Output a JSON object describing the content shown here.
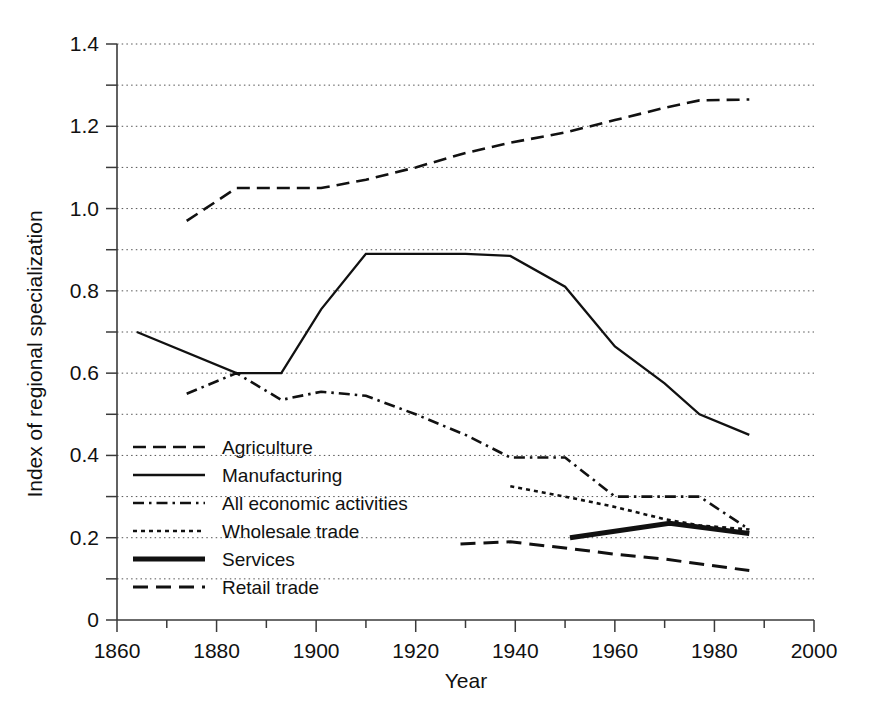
{
  "chart_data": {
    "type": "line",
    "title": "",
    "xlabel": "Year",
    "ylabel": "Index of regional specialization",
    "xlim": [
      1860,
      2000
    ],
    "ylim": [
      0,
      1.4
    ],
    "xticks": [
      1860,
      1880,
      1900,
      1920,
      1940,
      1960,
      1980,
      2000
    ],
    "xtick_labels": [
      "1860",
      "1880",
      "1900",
      "1920",
      "1940",
      "1960",
      "1980",
      "2000"
    ],
    "xminor_ticks": [
      1870,
      1890,
      1910,
      1930,
      1950,
      1970,
      1990
    ],
    "yticks": [
      0,
      0.2,
      0.4,
      0.6,
      0.8,
      1.0,
      1.2,
      1.4
    ],
    "ytick_labels": [
      "0",
      "0.2",
      "0.4",
      "0.6",
      "0.8",
      "1.0",
      "1.2",
      "1.4"
    ],
    "yminor_ticks": [
      0.1,
      0.3,
      0.5,
      0.7,
      0.9,
      1.1,
      1.3
    ],
    "grid": "horizontal-dotted-at-every-0.1",
    "legend_position": "lower-left-inside",
    "series": [
      {
        "name": "Agriculture",
        "style": "dashed",
        "x": [
          1874,
          1884,
          1893,
          1901,
          1910,
          1920,
          1930,
          1939,
          1950,
          1960,
          1970,
          1977,
          1987
        ],
        "y": [
          0.97,
          1.05,
          1.05,
          1.05,
          1.07,
          1.1,
          1.135,
          1.16,
          1.185,
          1.215,
          1.245,
          1.263,
          1.265
        ]
      },
      {
        "name": "Manufacturing",
        "style": "solid",
        "x": [
          1864,
          1884,
          1893,
          1901,
          1910,
          1920,
          1930,
          1939,
          1950,
          1960,
          1970,
          1977,
          1987
        ],
        "y": [
          0.7,
          0.6,
          0.6,
          0.755,
          0.89,
          0.89,
          0.89,
          0.885,
          0.81,
          0.665,
          0.575,
          0.5,
          0.45
        ]
      },
      {
        "name": "All economic activities",
        "style": "dash-dot",
        "x": [
          1874,
          1884,
          1893,
          1901,
          1910,
          1920,
          1930,
          1939,
          1950,
          1960,
          1970,
          1977,
          1987
        ],
        "y": [
          0.55,
          0.6,
          0.535,
          0.555,
          0.545,
          0.5,
          0.45,
          0.395,
          0.395,
          0.3,
          0.3,
          0.3,
          0.22
        ]
      },
      {
        "name": "Wholesale trade",
        "style": "dotted",
        "x": [
          1939,
          1950,
          1960,
          1970,
          1977,
          1987
        ],
        "y": [
          0.325,
          0.3,
          0.275,
          0.245,
          0.23,
          0.22
        ]
      },
      {
        "name": "Services",
        "style": "solid-thick",
        "x": [
          1951,
          1971,
          1987
        ],
        "y": [
          0.2,
          0.235,
          0.21
        ]
      },
      {
        "name": "Retail trade",
        "style": "long-dashed",
        "x": [
          1929,
          1939,
          1950,
          1960,
          1970,
          1987
        ],
        "y": [
          0.185,
          0.19,
          0.175,
          0.16,
          0.148,
          0.12
        ]
      }
    ]
  },
  "legend": {
    "items": [
      {
        "label": "Agriculture"
      },
      {
        "label": "Manufacturing"
      },
      {
        "label": "All economic activities"
      },
      {
        "label": "Wholesale trade"
      },
      {
        "label": "Services"
      },
      {
        "label": "Retail trade"
      }
    ]
  },
  "axes": {
    "x_title": "Year",
    "y_title": "Index of regional specialization"
  }
}
